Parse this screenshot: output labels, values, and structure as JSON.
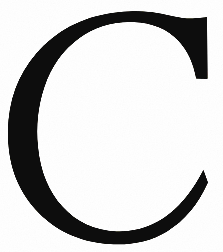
{
  "image": {
    "kind": "scanned-glyph-plate",
    "subject": "letter-c",
    "character": "C",
    "script": "latin",
    "case": "uppercase",
    "typeface_style": "serif",
    "width_px": 223,
    "height_px": 252,
    "background_color": "#ffffff",
    "ink_color": "#100f0d",
    "alt_text": "Large black serif capital letter C on a plain white background"
  },
  "glyph": {
    "label": "C",
    "bounding_box": {
      "x": 8,
      "y": 14,
      "width": 200,
      "height": 227
    },
    "stroke": {
      "max_thickness_px": 49,
      "min_thickness_px": 13,
      "thickest_at": "left-bowl-middle",
      "thinnest_at": "top-arc"
    },
    "terminals": [
      {
        "name": "upper-right-terminal",
        "type": "beak-serif-spur",
        "cut": "vertical",
        "x": 207,
        "y_top": 17,
        "y_bottom": 79
      },
      {
        "name": "lower-right-terminal",
        "type": "tapered-point",
        "cut": "oblique",
        "x": 208,
        "y_top": 181,
        "y_bottom": 206
      }
    ],
    "counter": {
      "name": "inner-counter",
      "shape": "open-oval",
      "fill": "#ffffff",
      "aperture_side": "right"
    },
    "outline_path": "M 207.0 17.2 L 207.5 78.8 L 196.2 78.6 C 193.4 63.0 187.6 50.4 178.6 40.9 C 167.4 29.1 152.3 22.8 133.2 22.1 C 113.0 21.4 95.0 26.7 79.4 38.1 C 63.0 50.0 51.2 66.6 44.2 87.6 C 38.0 106.2 35.9 126.1 38.0 147.2 C 40.4 171.4 48.6 191.3 62.4 206.6 C 76.6 222.3 94.6 230.6 116.2 231.4 C 136.0 232.1 153.8 226.2 169.4 213.8 C 182.6 203.3 193.9 188.6 203.4 169.9 L 207.9 182.6 C 198.0 204.7 184.4 221.0 167.0 231.4 C 150.3 241.4 131.0 245.6 109.0 244.0 C 78.9 241.8 54.3 230.2 35.3 209.2 C 16.8 188.8 7.7 162.9 8.0 131.6 C 8.3 101.0 17.8 75.0 36.3 53.6 C 55.7 31.1 81.0 17.6 112.2 13.0 C 131.6 10.1 151.0 11.1 170.4 15.8 C 177.1 17.4 182.6 18.3 186.9 18.4 C 192.3 18.5 198.9 18.1 207.0 17.2 Z"
  },
  "colors": {
    "ink": "#100f0d",
    "paper": "#ffffff",
    "edge_soft": "#2a2724"
  }
}
